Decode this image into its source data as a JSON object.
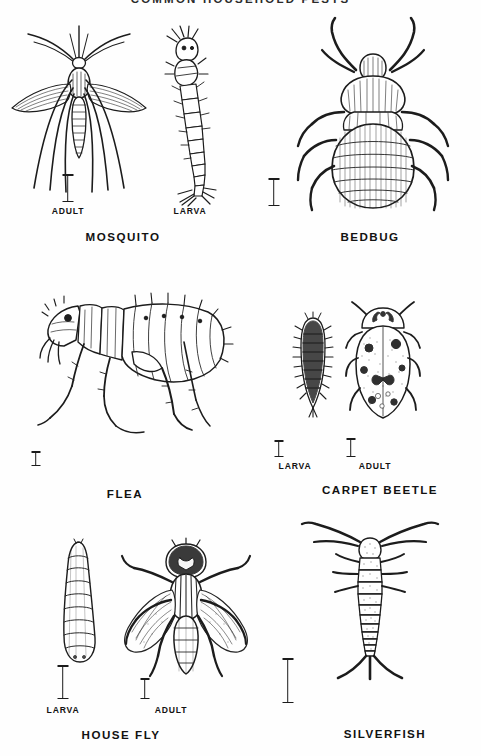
{
  "plate": {
    "title": "COMMON  HOUSEHOLD  PESTS",
    "background_color": "#fefefe",
    "ink_color": "#1c1c1c",
    "style": "black-and-white line engraving / scanned identification plate"
  },
  "labels": {
    "adult": "ADULT",
    "larva": "LARVA"
  },
  "specimens": [
    {
      "name": "MOSQUITO",
      "group_label": "MOSQUITO",
      "row": 1,
      "column": 1,
      "stages": [
        {
          "stage_label": "ADULT",
          "view": "dorsal",
          "icon": "mosquito-adult-icon",
          "has_scale_bar": true
        },
        {
          "stage_label": "LARVA",
          "view": "lateral",
          "icon": "mosquito-larva-icon",
          "has_scale_bar": false
        }
      ]
    },
    {
      "name": "BEDBUG",
      "group_label": "BEDBUG",
      "row": 1,
      "column": 2,
      "stages": [
        {
          "stage_label": "",
          "view": "dorsal",
          "icon": "bedbug-adult-icon",
          "has_scale_bar": true
        }
      ]
    },
    {
      "name": "FLEA",
      "group_label": "FLEA",
      "row": 2,
      "column": 1,
      "stages": [
        {
          "stage_label": "",
          "view": "lateral",
          "icon": "flea-adult-icon",
          "has_scale_bar": true
        }
      ]
    },
    {
      "name": "CARPET BEETLE",
      "group_label": "CARPET  BEETLE",
      "row": 2,
      "column": 2,
      "stages": [
        {
          "stage_label": "LARVA",
          "view": "dorsal",
          "icon": "carpet-beetle-larva-icon",
          "has_scale_bar": true
        },
        {
          "stage_label": "ADULT",
          "view": "dorsal",
          "icon": "carpet-beetle-adult-icon",
          "has_scale_bar": true
        }
      ]
    },
    {
      "name": "HOUSEFLY",
      "group_label": "HOUSE FLY",
      "row": 3,
      "column": 1,
      "stages": [
        {
          "stage_label": "LARVA",
          "view": "lateral",
          "icon": "housefly-larva-icon",
          "has_scale_bar": true
        },
        {
          "stage_label": "ADULT",
          "view": "dorsal",
          "icon": "housefly-adult-icon",
          "has_scale_bar": true
        }
      ]
    },
    {
      "name": "SILVERFISH",
      "group_label": "SILVERFISH",
      "row": 3,
      "column": 2,
      "stages": [
        {
          "stage_label": "",
          "view": "dorsal",
          "icon": "silverfish-icon",
          "has_scale_bar": true
        }
      ]
    }
  ]
}
